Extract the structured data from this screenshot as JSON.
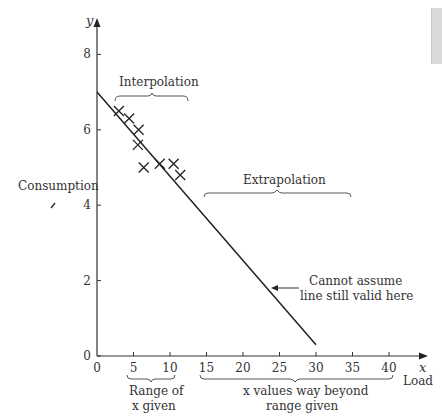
{
  "chart_data": {
    "type": "scatter",
    "title": "",
    "xlabel": "Load",
    "ylabel": "Consumption",
    "x_axis_symbol": "x",
    "y_axis_symbol": "y",
    "xlim": [
      0,
      40
    ],
    "ylim": [
      0,
      8
    ],
    "x_ticks": [
      0,
      5,
      10,
      15,
      20,
      25,
      30,
      35,
      40
    ],
    "y_ticks": [
      0,
      2,
      4,
      6,
      8
    ],
    "grid": false,
    "series": [
      {
        "name": "Observed data",
        "marker": "x",
        "points": [
          {
            "x": 3.0,
            "y": 6.5
          },
          {
            "x": 4.4,
            "y": 6.3
          },
          {
            "x": 5.7,
            "y": 6.0
          },
          {
            "x": 5.6,
            "y": 5.6
          },
          {
            "x": 6.4,
            "y": 5.0
          },
          {
            "x": 8.6,
            "y": 5.1
          },
          {
            "x": 10.5,
            "y": 5.1
          },
          {
            "x": 11.4,
            "y": 4.8
          }
        ]
      },
      {
        "name": "Regression line",
        "type": "line",
        "points": [
          {
            "x": 0,
            "y": 7.0
          },
          {
            "x": 30,
            "y": 0.3
          }
        ]
      }
    ],
    "annotations": {
      "interpolation": "Interpolation",
      "extrapolation": "Extrapolation",
      "cannot_assume_line1": "Cannot assume",
      "cannot_assume_line2": "line still valid here",
      "range_given_line1": "Range of",
      "range_given_line2": "x given",
      "beyond_line1": "x values way beyond",
      "beyond_line2": "range given"
    }
  }
}
